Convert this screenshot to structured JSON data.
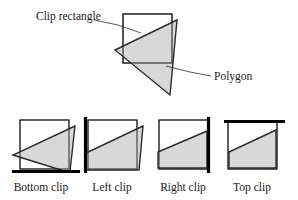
{
  "figure": {
    "title_caption": "Polygon clipping against a rectangle",
    "annotations": [
      {
        "id": "clip-rectangle",
        "text": "Clip rectangle",
        "x": 36,
        "y": 20
      },
      {
        "id": "polygon",
        "text": "Polygon",
        "x": 214,
        "y": 77
      }
    ],
    "captions": [
      {
        "id": "bottom-clip",
        "text": "Bottom clip",
        "x": 41,
        "y": 190
      },
      {
        "id": "left-clip",
        "text": "Left clip",
        "x": 110,
        "y": 190
      },
      {
        "id": "right-clip",
        "text": "Right clip",
        "x": 181,
        "y": 190
      },
      {
        "id": "top-clip",
        "text": "Top clip",
        "x": 250,
        "y": 190
      }
    ],
    "colors": {
      "polygon_fill": "#d6d6d6",
      "outline": "#2b2b2b",
      "clip_edge": "#000000",
      "background": "#ffffff",
      "text": "#1a1a1a"
    },
    "main_figure": {
      "id": "original-overlap",
      "clip_rect": {
        "x": 123,
        "y": 14,
        "width": 49,
        "height": 49
      },
      "polygon_points": "177,20 115,50 170,95",
      "leader_clip_rect": "94,20 118,25 140,33",
      "leader_polygon": "211,76 189,72 165,66"
    },
    "stages": [
      {
        "id": "bottom-clip",
        "caption": "Bottom clip",
        "clip_rect": {
          "x": 20,
          "y": 120,
          "width": 49,
          "height": 49
        },
        "polygon_points": "75,126 13,155 68,172 70,172",
        "edge_type": "horizontal",
        "edge": {
          "x1": 12,
          "y1": 171,
          "x2": 80,
          "y2": 171
        }
      },
      {
        "id": "left-clip",
        "caption": "Left clip",
        "clip_rect": {
          "x": 88,
          "y": 120,
          "width": 49,
          "height": 49
        },
        "polygon_points": "143,126 85,153 85,171 139,171",
        "edge_type": "vertical",
        "edge": {
          "x1": 85,
          "y1": 118,
          "x2": 85,
          "y2": 173
        }
      },
      {
        "id": "right-clip",
        "caption": "Right clip",
        "clip_rect": {
          "x": 159,
          "y": 120,
          "width": 49,
          "height": 49
        },
        "polygon_points": "208,131 157,152 157,169 208,169",
        "edge_type": "vertical",
        "edge": {
          "x1": 208,
          "y1": 118,
          "x2": 208,
          "y2": 173
        }
      },
      {
        "id": "top-clip",
        "caption": "Top clip",
        "clip_rect": {
          "x": 228,
          "y": 122,
          "width": 49,
          "height": 47
        },
        "polygon_points": "277,130 227,152 227,169 277,169",
        "edge_type": "horizontal",
        "edge": {
          "x1": 224,
          "y1": 121,
          "x2": 284,
          "y2": 121
        }
      }
    ]
  }
}
